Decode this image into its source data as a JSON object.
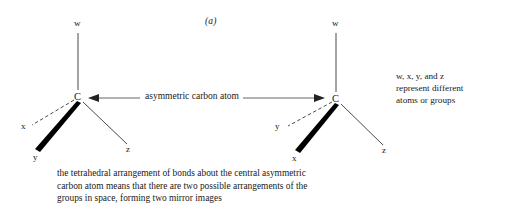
{
  "figure": {
    "label": "(a)",
    "arrow_annotation": "asymmetric carbon atom"
  },
  "molecules": [
    {
      "name": "left-enantiomer",
      "center_atom": "C",
      "bonds": [
        {
          "label": "w",
          "style": "plain",
          "direction": "up"
        },
        {
          "label": "x",
          "style": "dashed",
          "direction": "left"
        },
        {
          "label": "y",
          "style": "wedge",
          "direction": "down-left"
        },
        {
          "label": "z",
          "style": "plain",
          "direction": "down-right"
        }
      ]
    },
    {
      "name": "right-enantiomer",
      "center_atom": "C",
      "bonds": [
        {
          "label": "w",
          "style": "plain",
          "direction": "up"
        },
        {
          "label": "y",
          "style": "dashed",
          "direction": "left"
        },
        {
          "label": "x",
          "style": "wedge",
          "direction": "down-left"
        },
        {
          "label": "z",
          "style": "plain",
          "direction": "down-right"
        }
      ]
    }
  ],
  "side_note": {
    "lines": [
      "w, x, y, and z",
      "represent different",
      "atoms or groups"
    ]
  },
  "caption": {
    "lines": [
      "the tetrahedral arrangement of bonds about the central asymmetric",
      "carbon atom means that there are two possible arrangements of the",
      "groups in space, forming two mirror images"
    ]
  },
  "colors": {
    "background": "#ffffff",
    "ink": "#1a1a1a",
    "bond": "#4a4a4a",
    "wedge": "#000000"
  }
}
